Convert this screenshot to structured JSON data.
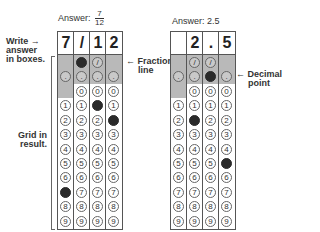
{
  "left": {
    "answer_prefix": "Answer:",
    "answer_num": "7",
    "answer_den": "12",
    "boxes": [
      "7",
      "/",
      "1",
      "2"
    ],
    "filled": {
      "slash": [
        1
      ],
      "dot": [],
      "digits": {
        "0": "7",
        "2": "1",
        "3": "2"
      }
    }
  },
  "right": {
    "answer": "Answer: 2.5",
    "boxes": [
      "",
      "2",
      ".",
      "5"
    ],
    "filled": {
      "slash": [],
      "dot": [
        2
      ],
      "digits": {
        "1": "2",
        "3": "5"
      }
    }
  },
  "annotations": {
    "write_answer": "Write answer in boxes.",
    "write_line1": "Write",
    "write_line2": "answer",
    "write_line3": "in boxes.",
    "arrow": "→",
    "grid_line1": "Grid in",
    "grid_line2": "result.",
    "fraction_arrow": "←",
    "fraction_line1": "Fraction",
    "fraction_line2": "line",
    "decimal_arrow": "←",
    "decimal_line1": "Decimal",
    "decimal_line2": "point"
  },
  "symbols": {
    "slash": "/",
    "dot": ".",
    "digits": [
      "0",
      "1",
      "2",
      "3",
      "4",
      "5",
      "6",
      "7",
      "8",
      "9"
    ]
  },
  "colors": {
    "gray_band": "#b9b9b9",
    "filled": "#2a2a2a",
    "border": "#555555"
  }
}
